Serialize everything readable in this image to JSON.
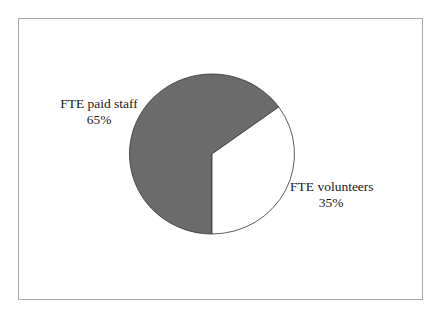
{
  "chart_data": {
    "type": "pie",
    "title": "",
    "categories": [
      "FTE paid staff",
      "FTE volunteers"
    ],
    "values": [
      65,
      35
    ],
    "value_labels": [
      "65%",
      "35%"
    ],
    "colors": [
      "#6b6b6b",
      "#ffffff"
    ],
    "legend": "none",
    "data_labels": "category name and percentage, outside slices",
    "start_angle_note": "gray slice spans from 6 o'clock clockwise to ~1:48 position; white slice spans the remainder"
  },
  "labels": {
    "paid_name": "FTE paid staff",
    "paid_pct": "65%",
    "vol_name": "FTE volunteers",
    "vol_pct": "35%"
  },
  "colors": {
    "frame_border": "#a8a8a8",
    "slice_paid": "#6b6b6b",
    "slice_volunteers": "#ffffff",
    "slice_outline": "#333333"
  }
}
